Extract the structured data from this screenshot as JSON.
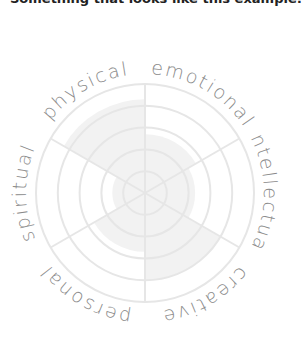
{
  "header": {
    "text": "Something that looks like this example:"
  },
  "chart": {
    "center": [
      145,
      193
    ],
    "radius": 109,
    "rings": 5,
    "fill_color": "#f2f2f2",
    "grid_color": "#e6e6e6",
    "label_color": "#8a8a8a"
  },
  "chart_data": {
    "type": "polar-area",
    "title": "",
    "categories": [
      "emotional",
      "intellectual",
      "creative",
      "personal",
      "spiritual",
      "physical"
    ],
    "values": [
      2.7,
      2.3,
      4.0,
      2.7,
      1.5,
      4.3
    ],
    "scale": [
      0,
      5
    ],
    "rings": 5,
    "grid": true,
    "legend": "none"
  }
}
